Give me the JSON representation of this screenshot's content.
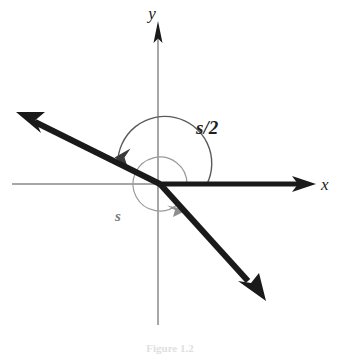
{
  "figure": {
    "kind": "angle-diagram",
    "width": 341,
    "height": 356,
    "background_color": "#ffffff",
    "caption_fragment": "Figure 1.2"
  },
  "colors": {
    "axis": "#8a8a8a",
    "axis_arrow": "#1a1a1a",
    "ray": "#1a1a1a",
    "arc_major": "#5a5a5a",
    "arc_minor": "#9a9a9a",
    "arc_major_arrow": "#3a3a3a",
    "arc_minor_arrow": "#8f8f8f",
    "label_major": "#1f1f1f",
    "label_minor": "#7a7a7a",
    "caption": "#b9b9b9"
  },
  "origin": {
    "x": 160,
    "y": 184
  },
  "axes": [
    {
      "id": "y-axis",
      "label": "y",
      "label_x": 152,
      "label_y": 19,
      "x1": 158,
      "y1": 22,
      "x2": 158,
      "y2": 325,
      "has_arrow": true,
      "arrow_at": "top"
    },
    {
      "id": "x-axis",
      "label": "x",
      "label_x": 321,
      "label_y": 190,
      "x1": 12,
      "y1": 184,
      "x2": 316,
      "y2": 184,
      "has_arrow": true,
      "arrow_at": "right"
    }
  ],
  "rays": [
    {
      "id": "ray-upper-left",
      "from_x": 160,
      "from_y": 184,
      "to_x": 19,
      "to_y": 114,
      "stroke_width": 6,
      "arrow": true,
      "description": "heavy ray from origin toward upper left"
    },
    {
      "id": "ray-lower-right",
      "from_x": 160,
      "from_y": 184,
      "to_x": 264,
      "to_y": 299,
      "stroke_width": 6,
      "arrow": true,
      "description": "heavy ray from origin toward lower right"
    },
    {
      "id": "ray-positive-x",
      "from_x": 160,
      "from_y": 184,
      "to_x": 304,
      "to_y": 184,
      "stroke_width": 5,
      "arrow": false,
      "description": "heavy initial side along positive x axis"
    }
  ],
  "arcs": [
    {
      "id": "arc-half-angle",
      "label": "s/2",
      "label_x": 196,
      "label_y": 134,
      "radius": 47,
      "start_angle_deg": 0,
      "end_angle_deg": 206,
      "direction": "counterclockwise",
      "stroke_width": 1.4,
      "terminal_ray": "ray-upper-left"
    },
    {
      "id": "arc-full-angle",
      "label": "s",
      "label_x": 115,
      "label_y": 221,
      "radius": 27,
      "start_angle_deg": 0,
      "end_angle_deg": 312,
      "direction": "counterclockwise",
      "stroke_width": 1.2,
      "terminal_ray": "ray-lower-right"
    }
  ]
}
